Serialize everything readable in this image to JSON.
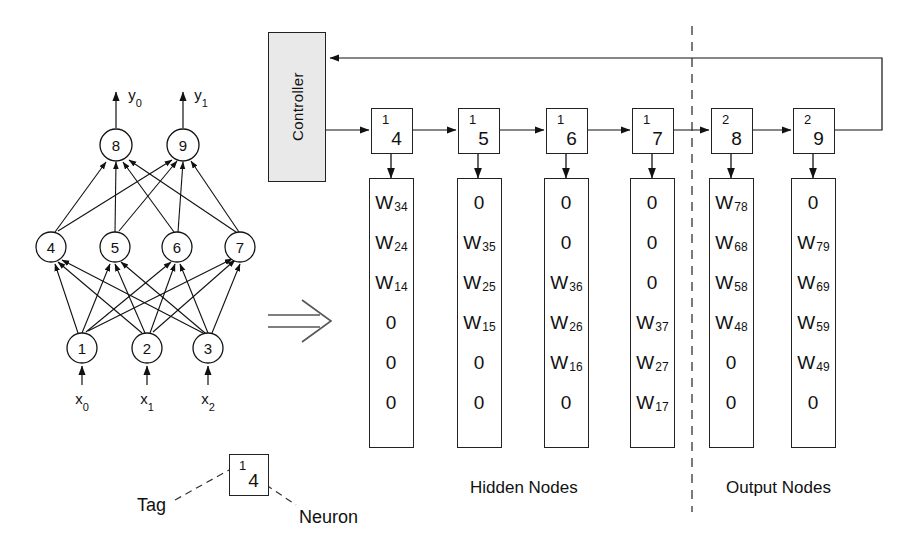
{
  "figure": {
    "implication_symbol": "⟹"
  },
  "controller": {
    "label": "Controller"
  },
  "network": {
    "output_signals": [
      {
        "name": "y",
        "sub": "0"
      },
      {
        "name": "y",
        "sub": "1"
      }
    ],
    "input_signals": [
      {
        "name": "x",
        "sub": "0"
      },
      {
        "name": "x",
        "sub": "1"
      },
      {
        "name": "x",
        "sub": "2"
      }
    ],
    "nodes": [
      {
        "id": "1",
        "label": "1",
        "cx": 82,
        "cy": 348
      },
      {
        "id": "2",
        "label": "2",
        "cx": 147,
        "cy": 348
      },
      {
        "id": "3",
        "label": "3",
        "cx": 208,
        "cy": 348
      },
      {
        "id": "4",
        "label": "4",
        "cx": 51,
        "cy": 247
      },
      {
        "id": "5",
        "label": "5",
        "cx": 115,
        "cy": 247
      },
      {
        "id": "6",
        "label": "6",
        "cx": 177,
        "cy": 247
      },
      {
        "id": "7",
        "label": "7",
        "cx": 240,
        "cy": 247
      },
      {
        "id": "8",
        "label": "8",
        "cx": 116,
        "cy": 145
      },
      {
        "id": "9",
        "label": "9",
        "cx": 183,
        "cy": 145
      }
    ]
  },
  "pipeline": {
    "node_boxes": [
      {
        "tag": "1",
        "neuron": "4",
        "x": 371,
        "group": "hidden"
      },
      {
        "tag": "1",
        "neuron": "5",
        "x": 458,
        "group": "hidden"
      },
      {
        "tag": "1",
        "neuron": "6",
        "x": 546,
        "group": "hidden"
      },
      {
        "tag": "1",
        "neuron": "7",
        "x": 632,
        "group": "hidden"
      },
      {
        "tag": "2",
        "neuron": "8",
        "x": 711,
        "group": "output"
      },
      {
        "tag": "2",
        "neuron": "9",
        "x": 793,
        "group": "output"
      }
    ],
    "weight_columns": [
      {
        "x": 369,
        "cells": [
          {
            "w": "W",
            "sub": "34"
          },
          {
            "w": "W",
            "sub": "24"
          },
          {
            "w": "W",
            "sub": "14"
          },
          {
            "w": "0",
            "sub": ""
          },
          {
            "w": "0",
            "sub": ""
          },
          {
            "w": "0",
            "sub": ""
          }
        ]
      },
      {
        "x": 457,
        "cells": [
          {
            "w": "0",
            "sub": ""
          },
          {
            "w": "W",
            "sub": "35"
          },
          {
            "w": "W",
            "sub": "25"
          },
          {
            "w": "W",
            "sub": "15"
          },
          {
            "w": "0",
            "sub": ""
          },
          {
            "w": "0",
            "sub": ""
          }
        ]
      },
      {
        "x": 544,
        "cells": [
          {
            "w": "0",
            "sub": ""
          },
          {
            "w": "0",
            "sub": ""
          },
          {
            "w": "W",
            "sub": "36"
          },
          {
            "w": "W",
            "sub": "26"
          },
          {
            "w": "W",
            "sub": "16"
          },
          {
            "w": "0",
            "sub": ""
          }
        ]
      },
      {
        "x": 630,
        "cells": [
          {
            "w": "0",
            "sub": ""
          },
          {
            "w": "0",
            "sub": ""
          },
          {
            "w": "0",
            "sub": ""
          },
          {
            "w": "W",
            "sub": "37"
          },
          {
            "w": "W",
            "sub": "27"
          },
          {
            "w": "W",
            "sub": "17"
          }
        ]
      },
      {
        "x": 709,
        "cells": [
          {
            "w": "W",
            "sub": "78"
          },
          {
            "w": "W",
            "sub": "68"
          },
          {
            "w": "W",
            "sub": "58"
          },
          {
            "w": "W",
            "sub": "48"
          },
          {
            "w": "0",
            "sub": ""
          },
          {
            "w": "0",
            "sub": ""
          }
        ]
      },
      {
        "x": 791,
        "cells": [
          {
            "w": "0",
            "sub": ""
          },
          {
            "w": "W",
            "sub": "79"
          },
          {
            "w": "W",
            "sub": "69"
          },
          {
            "w": "W",
            "sub": "59"
          },
          {
            "w": "W",
            "sub": "49"
          },
          {
            "w": "0",
            "sub": ""
          }
        ]
      }
    ],
    "section_labels": {
      "hidden": "Hidden Nodes",
      "output": "Output Nodes"
    }
  },
  "legend": {
    "tag_label": "Tag",
    "neuron_label": "Neuron",
    "example_box": {
      "tag": "1",
      "neuron": "4"
    }
  }
}
